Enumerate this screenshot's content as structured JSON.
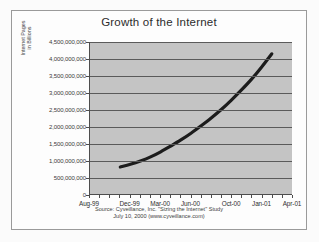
{
  "chart_data": {
    "type": "line",
    "title": "Growth of the Internet",
    "xlabel": "",
    "ylabel": "Internet Pages in Billions",
    "ylabel_lines": [
      "Internet Pages",
      "in Billions"
    ],
    "grid": true,
    "legend": "none",
    "ylim": [
      0,
      4500000000
    ],
    "ytick_labels": [
      "4,500,000,000",
      "4,000,000,000",
      "3,500,000,000",
      "3,000,000,000",
      "2,500,000,000",
      "2,000,000,000",
      "1,500,000,000",
      "1,000,000,000",
      "500,000,000",
      "0"
    ],
    "ytick_values": [
      4500000000,
      4000000000,
      3500000000,
      3000000000,
      2500000000,
      2000000000,
      1500000000,
      1000000000,
      500000000,
      0
    ],
    "xtick_labels": [
      "Aug-99",
      "Dec-99",
      "Mar-00",
      "Jun-00",
      "Oct-00",
      "Jan-01",
      "Apr-01"
    ],
    "xlim_labels": [
      "Aug-99",
      "Apr-01"
    ],
    "x_months": [
      "Aug-99",
      "Sep-99",
      "Oct-99",
      "Nov-99",
      "Dec-99",
      "Jan-00",
      "Feb-00",
      "Mar-00",
      "Apr-00",
      "May-00",
      "Jun-00",
      "Jul-00",
      "Aug-00",
      "Sep-00",
      "Oct-00",
      "Nov-00",
      "Dec-00",
      "Jan-01",
      "Feb-01",
      "Mar-01",
      "Apr-01"
    ],
    "series": [
      {
        "name": "Internet Pages",
        "x": [
          "Nov-99",
          "Dec-99",
          "Jan-00",
          "Feb-00",
          "Mar-00",
          "Apr-00",
          "May-00",
          "Jun-00",
          "Jul-00",
          "Aug-00",
          "Sep-00",
          "Oct-00",
          "Nov-00",
          "Dec-00",
          "Jan-01",
          "Feb-01"
        ],
        "values": [
          800000000,
          880000000,
          980000000,
          1100000000,
          1250000000,
          1420000000,
          1600000000,
          1800000000,
          2020000000,
          2250000000,
          2500000000,
          2780000000,
          3080000000,
          3400000000,
          3760000000,
          4150000000
        ]
      }
    ],
    "annotations": []
  },
  "source_note": {
    "line1": "Source: Cyveillance, Inc. \"Sizing the Internet\" Study",
    "line2": "July 10, 2000 (www.cyveillance.com)"
  },
  "colors": {
    "plot_background": "#c4c4c4",
    "gridline": "#5a5a5a",
    "curve": "#1c1c1c",
    "axis": "#4d4d4d",
    "frame": "#9a9a9a",
    "page_background": "#fbfbfb",
    "text": "#2f2f2f"
  },
  "scan_artifact": {
    "text": "             "
  }
}
